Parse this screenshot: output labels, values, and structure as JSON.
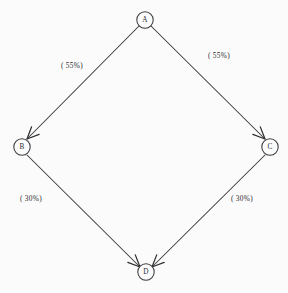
{
  "diagram": {
    "type": "directed-graph",
    "shape": "diamond",
    "background_color": "#fbfbfb",
    "stroke_color": "#37373b",
    "text_color": "#2b2b2f",
    "nodes": [
      {
        "id": "A",
        "label": "A",
        "x": 145,
        "y": 20,
        "radius": 8.2
      },
      {
        "id": "B",
        "label": "B",
        "x": 22,
        "y": 147,
        "radius": 8.2
      },
      {
        "id": "C",
        "label": "C",
        "x": 270,
        "y": 147,
        "radius": 8.2
      },
      {
        "id": "D",
        "label": "D",
        "x": 146,
        "y": 272,
        "radius": 8.2
      }
    ],
    "edges": [
      {
        "id": "a-to-b",
        "from": "A",
        "to": "B",
        "label": "( 55%)",
        "label_x": 72,
        "label_y": 65,
        "x1": 139,
        "y1": 26,
        "x2": 27,
        "y2": 139
      },
      {
        "id": "a-to-c",
        "from": "A",
        "to": "C",
        "label": "( 55%)",
        "label_x": 219,
        "label_y": 55,
        "x1": 151,
        "y1": 26,
        "x2": 265,
        "y2": 139
      },
      {
        "id": "b-to-d",
        "from": "B",
        "to": "D",
        "label": "( 30%)",
        "label_x": 31,
        "label_y": 198,
        "x1": 27,
        "y1": 155,
        "x2": 140,
        "y2": 267
      },
      {
        "id": "c-to-d",
        "from": "C",
        "to": "D",
        "label": "( 30%)",
        "label_x": 242,
        "label_y": 198,
        "x1": 265,
        "y1": 155,
        "x2": 152,
        "y2": 267
      }
    ]
  }
}
